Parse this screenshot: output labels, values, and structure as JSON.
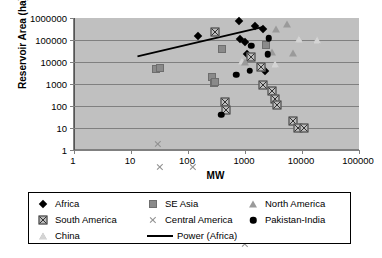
{
  "chart_data": {
    "type": "scatter",
    "title": "",
    "xlabel": "MW",
    "ylabel": "Reservoir Area (ha)",
    "xscale": "log",
    "yscale": "log",
    "xlim": [
      1,
      100000
    ],
    "ylim": [
      1,
      1000000
    ],
    "xticks": [
      "1",
      "10",
      "100",
      "1000",
      "10000",
      "100000"
    ],
    "yticks": [
      "1",
      "10",
      "100",
      "1000",
      "10000",
      "100000",
      "1000000"
    ],
    "grid": "horizontal",
    "legend_position": "bottom",
    "plot_background": "#c0c0c0",
    "series": [
      {
        "name": "Africa",
        "marker": "diamond-filled",
        "color": "#000000",
        "points": [
          [
            150,
            150000
          ],
          [
            800,
            700000
          ],
          [
            830,
            110000
          ],
          [
            1000,
            80000
          ],
          [
            1100,
            22000
          ],
          [
            1500,
            450000
          ],
          [
            2100,
            330000
          ],
          [
            2200,
            3800
          ]
        ]
      },
      {
        "name": "South America",
        "marker": "square-crossed",
        "color": "#333333",
        "points": [
          [
            300,
            230000
          ],
          [
            450,
            380
          ],
          [
            460,
            420
          ],
          [
            1250,
            300000
          ],
          [
            1900,
            250000
          ],
          [
            2100,
            95000
          ],
          [
            3000,
            130000
          ],
          [
            3400,
            150000
          ],
          [
            3600,
            210000
          ],
          [
            7000,
            100000
          ],
          [
            8500,
            120000
          ],
          [
            11000,
            330000
          ]
        ]
      },
      {
        "name": "China",
        "marker": "triangle-open",
        "color": "#8f8f8f",
        "points": [
          [
            900,
            11000
          ],
          [
            3300,
            8000
          ],
          [
            9000,
            110000
          ],
          [
            18000,
            95000
          ]
        ]
      },
      {
        "name": "SE Asia",
        "marker": "square-filled",
        "color": "#8a8a8a",
        "points": [
          [
            28,
            4800
          ],
          [
            32,
            5600
          ],
          [
            260,
            2100
          ],
          [
            290,
            1100
          ],
          [
            300,
            1250
          ],
          [
            400,
            37000
          ],
          [
            2300,
            60000
          ]
        ]
      },
      {
        "name": "Central America",
        "marker": "x",
        "color": "#8f8f8f",
        "points": [
          [
            30,
            150000
          ],
          [
            32,
            33000
          ],
          [
            120,
            70000
          ],
          [
            180,
            6200
          ],
          [
            310,
            6500
          ],
          [
            400,
            6600
          ],
          [
            480,
            6700
          ],
          [
            1000,
            1450
          ]
        ]
      },
      {
        "name": "North America",
        "marker": "triangle-filled",
        "color": "#9a9a9a",
        "points": [
          [
            1000,
            9500
          ],
          [
            3000,
            30000
          ],
          [
            3500,
            330000
          ],
          [
            5500,
            560000
          ],
          [
            7000,
            25000
          ]
        ]
      },
      {
        "name": "Pakistan-India",
        "marker": "circle-filled",
        "color": "#000000",
        "points": [
          [
            380,
            40
          ],
          [
            700,
            2600
          ],
          [
            1200,
            4000
          ],
          [
            1300,
            55000
          ],
          [
            2500,
            22000
          ],
          [
            2600,
            120000
          ]
        ]
      }
    ],
    "trendline": {
      "name": "Power (Africa)",
      "color": "#000000",
      "from": [
        13,
        18000
      ],
      "to": [
        2100,
        400000
      ]
    }
  },
  "legend": {
    "rows": [
      [
        {
          "label": "Africa",
          "marker": "diamond-filled"
        },
        {
          "label": "SE Asia",
          "marker": "square-filled"
        },
        {
          "label": "North America",
          "marker": "triangle-filled"
        }
      ],
      [
        {
          "label": "South America",
          "marker": "square-crossed"
        },
        {
          "label": "Central America",
          "marker": "x"
        },
        {
          "label": "Pakistan-India",
          "marker": "circle-filled"
        }
      ],
      [
        {
          "label": "China",
          "marker": "triangle-open"
        },
        {
          "label": "Power (Africa)",
          "marker": "line"
        }
      ]
    ]
  }
}
